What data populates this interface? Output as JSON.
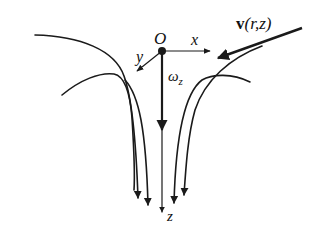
{
  "diagram": {
    "type": "vortex-flow-sketch",
    "labels": {
      "origin": "O",
      "x_axis": "x",
      "y_axis": "y",
      "z_axis": "z",
      "omega": "ω",
      "omega_sub": "z",
      "velocity_bold": "v",
      "velocity_args": "(r,z)"
    },
    "elements": [
      "origin-point",
      "x-axis-arrow",
      "y-axis-arrow",
      "z-axis-arrow",
      "omega-z-arrow",
      "velocity-vector-arrow",
      "streamlines"
    ],
    "streamline_count": 5,
    "colors": {
      "ink": "#1a1a1a",
      "background": "#ffffff"
    }
  }
}
